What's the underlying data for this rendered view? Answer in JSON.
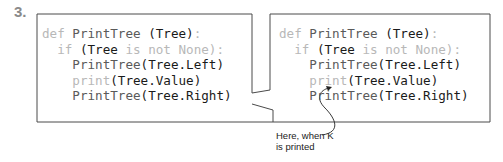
{
  "step": {
    "number": "3."
  },
  "colors": {
    "frame": "#4a4a4a",
    "keyword": "#b8b8b8",
    "call": "#5a5a5a",
    "emphasis": "#1a1a1a"
  },
  "frames": [
    {
      "name": "left",
      "lines": [
        [
          {
            "t": "def ",
            "s": "dim"
          },
          {
            "t": "PrintTree",
            "s": "mid"
          },
          {
            "t": " (Tree)",
            "s": "dark"
          },
          {
            "t": ":",
            "s": "dim"
          }
        ],
        [
          {
            "t": "  if ",
            "s": "dim"
          },
          {
            "t": "(Tree",
            "s": "dark"
          },
          {
            "t": " is not None",
            "s": "dim"
          },
          {
            "t": "):",
            "s": "dim"
          }
        ],
        [
          {
            "t": "    PrintTree",
            "s": "mid"
          },
          {
            "t": "(Tree.Left)",
            "s": "dark"
          }
        ],
        [
          {
            "t": "    print",
            "s": "dim"
          },
          {
            "t": "(Tree.Value)",
            "s": "dark"
          }
        ],
        [
          {
            "t": "    PrintTree",
            "s": "mid"
          },
          {
            "t": "(Tree.Right)",
            "s": "dark"
          }
        ]
      ]
    },
    {
      "name": "right",
      "lines": [
        [
          {
            "t": "def ",
            "s": "dim"
          },
          {
            "t": "PrintTree",
            "s": "mid"
          },
          {
            "t": " (Tree)",
            "s": "dark"
          },
          {
            "t": ":",
            "s": "dim"
          }
        ],
        [
          {
            "t": "  if ",
            "s": "dim"
          },
          {
            "t": "(Tree",
            "s": "dark"
          },
          {
            "t": " is not None",
            "s": "dim"
          },
          {
            "t": "):",
            "s": "dim"
          }
        ],
        [
          {
            "t": "    PrintTree",
            "s": "mid"
          },
          {
            "t": "(Tree.Left)",
            "s": "dark"
          }
        ],
        [
          {
            "t": "    print",
            "s": "dim"
          },
          {
            "t": "(Tree.Value)",
            "s": "dark"
          }
        ],
        [
          {
            "t": "    PrintTree",
            "s": "mid"
          },
          {
            "t": "(Tree.Right)",
            "s": "dark"
          }
        ]
      ]
    }
  ],
  "annotation": {
    "line1": "Here, when K",
    "line2": "is printed"
  }
}
